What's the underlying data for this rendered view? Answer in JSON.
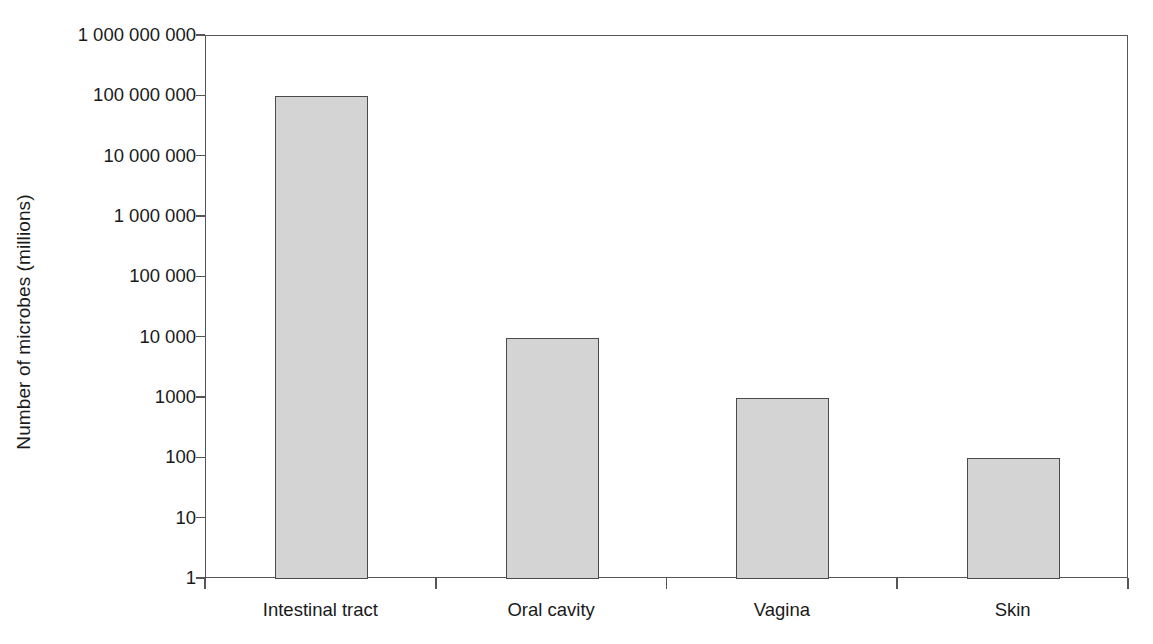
{
  "chart_data": {
    "type": "bar",
    "title": "",
    "xlabel": "",
    "ylabel": "Number of microbes (millions)",
    "categories": [
      "Intestinal tract",
      "Oral cavity",
      "Vagina",
      "Skin"
    ],
    "values": [
      100000000,
      10000,
      1000,
      100
    ],
    "value_labels": [
      "100 000 000",
      "10 000",
      "1000",
      "100"
    ],
    "yscale": "log",
    "ylim": [
      1,
      1000000000
    ],
    "ytick_values": [
      1000000000,
      100000000,
      10000000,
      1000000,
      100000,
      10000,
      1000,
      100,
      10,
      1
    ],
    "ytick_labels": [
      "1 000 000 000",
      "100 000 000",
      "10 000 000",
      "1 000 000",
      "100 000",
      "10 000",
      "1000",
      "100",
      "10",
      "1"
    ],
    "grid": false,
    "legend": false,
    "legend_position": "none",
    "bar_fill_color": "#d4d4d4",
    "bar_border_color": "#4a4a4a",
    "axis_color": "#555555",
    "background_color": "#ffffff",
    "text_color": "#1a1a1a"
  },
  "axes": {
    "y_title": "Number of microbes (millions)"
  }
}
